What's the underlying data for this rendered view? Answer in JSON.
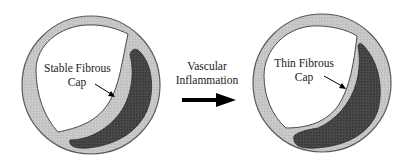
{
  "diagram": {
    "type": "atherosclerotic-plaque-progression",
    "left_panel": {
      "label_line1": "Stable Fibrous",
      "label_line2": "Cap"
    },
    "transition": {
      "label_line1": "Vascular",
      "label_line2": "Inflammation"
    },
    "right_panel": {
      "label_line1": "Thin Fibrous",
      "label_line2": "Cap"
    },
    "colors": {
      "vessel_wall": "#c4c4c4",
      "vessel_outline": "#5a5a5a",
      "lumen": "#ffffff",
      "lipid_core": "#3f3f3f",
      "arrow": "#000000"
    }
  }
}
